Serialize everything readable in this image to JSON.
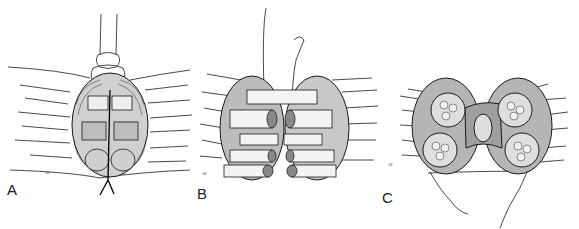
{
  "figure": {
    "panels": [
      {
        "label": "A",
        "description": "Fascicle groups of transected nerve approximated with epineurial sutures, proximal stump view with tube/clamp above"
      },
      {
        "label": "B",
        "description": "Fascicular groups aligned and sutured individually with long suture tails"
      },
      {
        "label": "C",
        "description": "Completed group fascicular repair, cross-section showing fascicle bundles with sutures"
      }
    ],
    "signature_marks": [
      "",
      "",
      ""
    ],
    "colors": {
      "ink": "#1a1a1a",
      "background": "#ffffff",
      "shading": "#9a9a9a"
    }
  }
}
